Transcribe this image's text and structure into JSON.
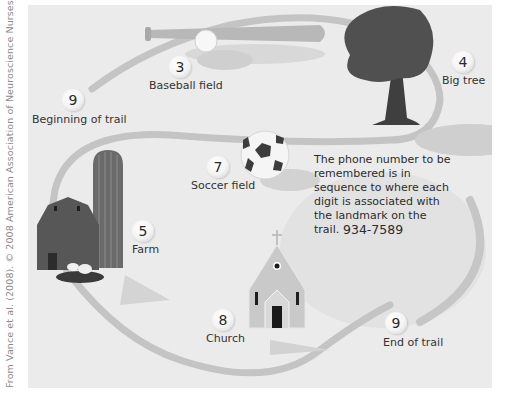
{
  "credit": "From Vance et al. (2008). © 2008 American Association of Neuroscience Nurses",
  "landmarks": [
    {
      "id": "beginning",
      "digit": "9",
      "label": "Beginning of trail"
    },
    {
      "id": "baseball",
      "digit": "3",
      "label": "Baseball field"
    },
    {
      "id": "tree",
      "digit": "4",
      "label": "Big tree"
    },
    {
      "id": "soccer",
      "digit": "7",
      "label": "Soccer field"
    },
    {
      "id": "farm",
      "digit": "5",
      "label": "Farm"
    },
    {
      "id": "church",
      "digit": "8",
      "label": "Church"
    },
    {
      "id": "end",
      "digit": "9",
      "label": "End of trail"
    }
  ],
  "note": {
    "text": "The phone number to be remembered is in sequence to where each digit is associated with the landmark on the trail.",
    "phone_number": "934-7589"
  },
  "colors": {
    "panel_bg": "#ebebeb",
    "trail": "#bdbdbd",
    "barn": "#5a5a5a",
    "tree": "#4a4a4a",
    "church": "#c8c8c8"
  }
}
